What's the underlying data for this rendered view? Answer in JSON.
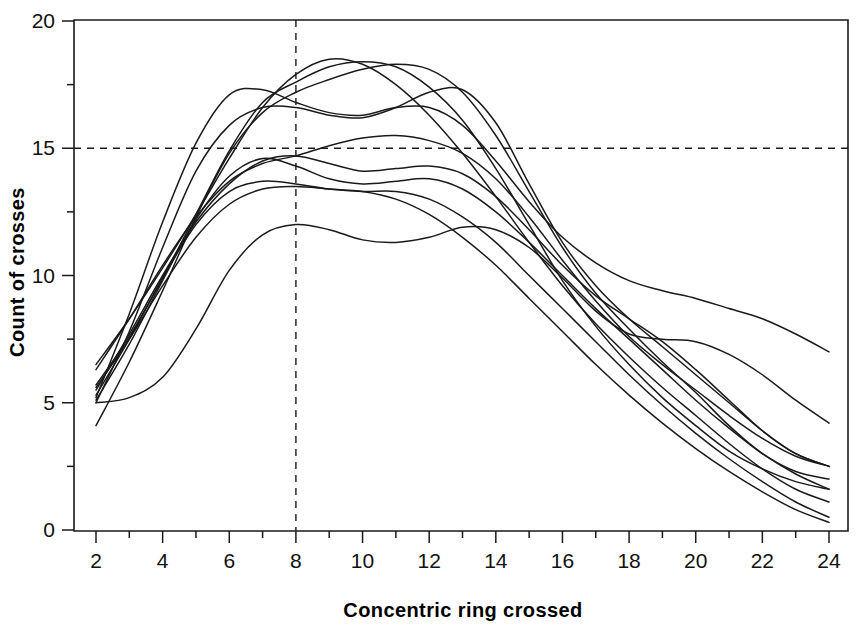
{
  "chart_data": {
    "type": "line",
    "title": "",
    "xlabel": "Concentric ring crossed",
    "ylabel": "Count of crosses",
    "xlim": [
      2,
      24
    ],
    "ylim": [
      0,
      20
    ],
    "grid": false,
    "legend": "none",
    "x_major_ticks": [
      2,
      4,
      6,
      8,
      10,
      12,
      14,
      16,
      18,
      20,
      22,
      24
    ],
    "x_minor_ticks": [
      3,
      5,
      7,
      9,
      11,
      13,
      15,
      17,
      19,
      21,
      23
    ],
    "y_major_ticks": [
      0,
      5,
      10,
      15,
      20
    ],
    "y_minor_ticks": [
      2.5,
      7.5,
      12.5,
      17.5
    ],
    "x_tick_labels": [
      "2",
      "4",
      "6",
      "8",
      "10",
      "12",
      "14",
      "16",
      "18",
      "20",
      "22",
      "24"
    ],
    "y_tick_labels": [
      "0",
      "5",
      "10",
      "15",
      "20"
    ],
    "annotations": [
      {
        "name": "horizontal-reference-line",
        "kind": "hline",
        "value": 15,
        "style": "dashed"
      },
      {
        "name": "vertical-reference-line",
        "kind": "vline",
        "value": 8,
        "style": "dashed"
      }
    ],
    "x": [
      2,
      3,
      4,
      5,
      6,
      7,
      8,
      9,
      10,
      11,
      12,
      13,
      14,
      15,
      16,
      17,
      18,
      19,
      20,
      21,
      22,
      23,
      24
    ],
    "series": [
      {
        "name": "subject-1",
        "values": [
          6.5,
          8.3,
          10.3,
          12.4,
          14.6,
          16.6,
          17.9,
          18.5,
          18.3,
          17.5,
          16.3,
          14.8,
          13.1,
          11.3,
          9.6,
          8.1,
          6.8,
          5.6,
          4.5,
          3.4,
          2.4,
          1.6,
          1.1
        ]
      },
      {
        "name": "subject-2",
        "values": [
          5.7,
          7.6,
          9.9,
          12.4,
          14.9,
          16.8,
          17.6,
          18.2,
          18.4,
          18.2,
          17.4,
          16.1,
          14.2,
          12.0,
          9.8,
          8.0,
          6.5,
          5.2,
          4.1,
          3.1,
          2.4,
          1.9,
          1.6
        ]
      },
      {
        "name": "subject-3",
        "values": [
          4.1,
          6.6,
          9.4,
          12.3,
          14.8,
          16.4,
          17.2,
          17.7,
          18.1,
          18.3,
          18.1,
          17.2,
          15.5,
          13.3,
          11.1,
          9.3,
          7.9,
          6.6,
          5.4,
          4.1,
          3.0,
          2.3,
          2.0
        ]
      },
      {
        "name": "subject-4",
        "values": [
          5.2,
          8.5,
          12.1,
          15.2,
          17.1,
          17.3,
          16.8,
          16.4,
          16.3,
          16.6,
          16.6,
          15.9,
          14.5,
          12.9,
          11.5,
          10.5,
          9.8,
          9.4,
          9.1,
          8.7,
          8.3,
          7.7,
          7.0
        ]
      },
      {
        "name": "subject-5",
        "values": [
          5.0,
          7.8,
          11.1,
          14.1,
          15.9,
          16.6,
          16.6,
          16.3,
          16.2,
          16.6,
          17.2,
          17.3,
          16.0,
          13.6,
          11.3,
          9.6,
          8.3,
          7.2,
          6.1,
          5.0,
          3.9,
          3.0,
          2.5
        ]
      },
      {
        "name": "subject-6",
        "values": [
          6.3,
          8.3,
          10.4,
          12.3,
          13.7,
          14.4,
          14.7,
          15.1,
          15.4,
          15.5,
          15.3,
          14.8,
          13.8,
          12.3,
          10.6,
          9.0,
          7.6,
          6.5,
          5.5,
          4.5,
          3.6,
          2.9,
          2.5
        ]
      },
      {
        "name": "subject-7",
        "values": [
          5.5,
          7.7,
          10.0,
          12.1,
          13.6,
          14.5,
          14.7,
          14.4,
          14.1,
          14.2,
          14.3,
          14.0,
          13.1,
          11.8,
          10.4,
          9.2,
          8.3,
          7.4,
          6.3,
          5.1,
          3.9,
          3.0,
          2.5
        ]
      },
      {
        "name": "subject-8",
        "values": [
          5.1,
          7.3,
          9.8,
          12.2,
          13.9,
          14.6,
          14.3,
          13.8,
          13.6,
          13.7,
          13.8,
          13.4,
          12.5,
          11.3,
          10.0,
          8.7,
          7.5,
          6.3,
          5.1,
          4.0,
          3.0,
          2.2,
          1.6
        ]
      },
      {
        "name": "subject-9",
        "values": [
          5.0,
          5.2,
          6.0,
          7.9,
          10.2,
          11.6,
          12.0,
          11.8,
          11.4,
          11.3,
          11.5,
          11.9,
          11.8,
          11.1,
          9.9,
          8.6,
          7.7,
          7.5,
          7.4,
          6.9,
          6.1,
          5.1,
          4.2
        ]
      },
      {
        "name": "subject-10",
        "values": [
          5.3,
          7.5,
          9.9,
          12.0,
          13.3,
          13.7,
          13.6,
          13.4,
          13.3,
          13.3,
          13.0,
          12.3,
          11.3,
          10.0,
          8.7,
          7.4,
          6.1,
          4.9,
          3.8,
          2.8,
          1.9,
          1.1,
          0.5
        ]
      },
      {
        "name": "subject-11",
        "values": [
          5.6,
          7.5,
          9.6,
          11.5,
          12.8,
          13.4,
          13.5,
          13.4,
          13.3,
          13.0,
          12.4,
          11.5,
          10.4,
          9.1,
          7.8,
          6.5,
          5.3,
          4.2,
          3.2,
          2.3,
          1.5,
          0.8,
          0.3
        ]
      }
    ]
  },
  "labels": {
    "x_axis_title": "Concentric ring crossed",
    "y_axis_title": "Count of crosses"
  }
}
